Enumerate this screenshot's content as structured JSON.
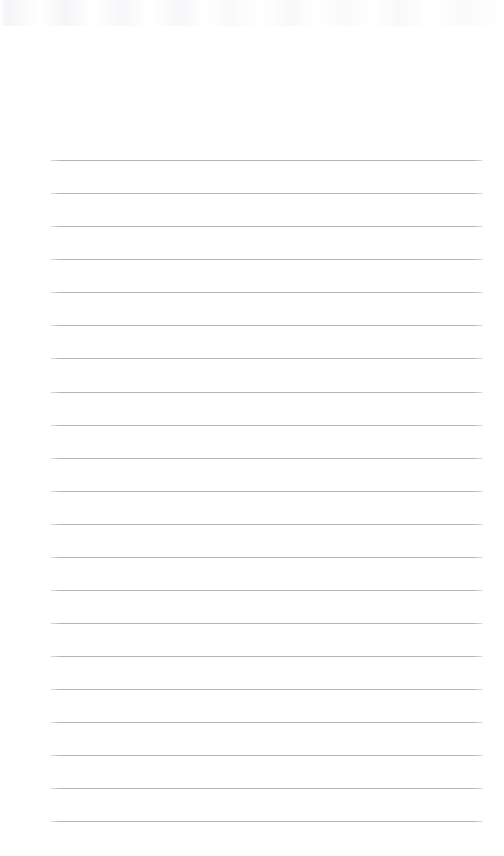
{
  "page": {
    "kind": "blank-ruled-sheet",
    "width": 504,
    "height": 856,
    "background_color": "#ffffff",
    "content_text": ""
  },
  "ruling": {
    "line_color": "#b3b6bb",
    "line_thickness": 1,
    "line_count": 21,
    "line_left": 50,
    "line_right": 483,
    "line_length": 433,
    "first_line_y": 160,
    "last_line_y": 821,
    "line_spacing": 33.05,
    "top_margin": 160,
    "bottom_margin": 35,
    "left_margin": 50,
    "right_margin": 21,
    "has_vertical_margin_rule": false,
    "has_header": false,
    "has_holes": false,
    "line_y_positions": [
      160,
      193,
      226,
      259,
      292,
      325,
      358,
      392,
      425,
      458,
      491,
      524,
      557,
      590,
      623,
      656,
      689,
      722,
      755,
      788,
      821
    ]
  },
  "artifacts": {
    "top_edge_scan_noise": true,
    "noise_color": "#f5f5f7",
    "noise_height": 26
  }
}
